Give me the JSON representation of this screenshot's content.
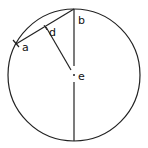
{
  "diagram": {
    "type": "circle-geometry",
    "stroke_color": "#222222",
    "background": "#ffffff",
    "circle": {
      "cx": 74,
      "cy": 75,
      "r": 66
    },
    "points": [
      {
        "id": "a",
        "label": "a",
        "x": 16,
        "y": 44
      },
      {
        "id": "b",
        "label": "b",
        "x": 74,
        "y": 9
      },
      {
        "id": "d",
        "label": "d",
        "x": 45,
        "y": 27
      },
      {
        "id": "e",
        "label": "e",
        "x": 74,
        "y": 75
      }
    ],
    "segments": [
      {
        "from": "a",
        "to": "b",
        "name": "chord-ab"
      },
      {
        "from": "d",
        "to": "e",
        "name": "perpendicular-de"
      },
      {
        "from": "b",
        "to": "e",
        "name": "radius-be"
      },
      {
        "from": "e",
        "to": "bottom",
        "name": "radius-e-bottom"
      }
    ],
    "labels": {
      "a": "a",
      "b": "b",
      "d": "d",
      "e": "e"
    }
  }
}
